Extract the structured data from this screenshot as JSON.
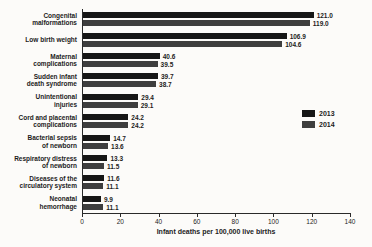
{
  "chart_data": {
    "type": "bar",
    "orientation": "horizontal",
    "title": "",
    "xlabel": "Infant deaths per 100,000 live births",
    "ylabel": "",
    "xlim": [
      0,
      140
    ],
    "x_ticks": [
      0,
      20,
      40,
      60,
      80,
      100,
      120,
      140
    ],
    "grid": "off",
    "legend_position": "right",
    "value_labels": "end-of-bar, one decimal",
    "categories": [
      "Congenital\nmalformations",
      "Low birth weight",
      "Maternal\ncomplications",
      "Sudden infant\ndeath syndrome",
      "Unintentional\ninjuries",
      "Cord and placental\ncomplications",
      "Bacterial sepsis\nof newborn",
      "Respiratory distress\nof newborn",
      "Diseases of the\ncirculatory system",
      "Neonatal\nhemorrhage"
    ],
    "series": [
      {
        "name": "2013",
        "color": "#161616",
        "values": [
          121.0,
          106.9,
          40.6,
          39.7,
          29.4,
          24.2,
          14.7,
          13.3,
          11.6,
          9.9
        ]
      },
      {
        "name": "2014",
        "color": "#3e3e3e",
        "values": [
          119.0,
          104.6,
          39.5,
          38.7,
          29.1,
          24.2,
          13.6,
          11.5,
          11.1,
          11.1
        ]
      }
    ],
    "colors": {
      "series_2013": "#161616",
      "series_2014": "#3e3e3e",
      "axis": "#2a2a2a",
      "text": "#1c1c1c",
      "background": "#fcfbf9"
    }
  }
}
